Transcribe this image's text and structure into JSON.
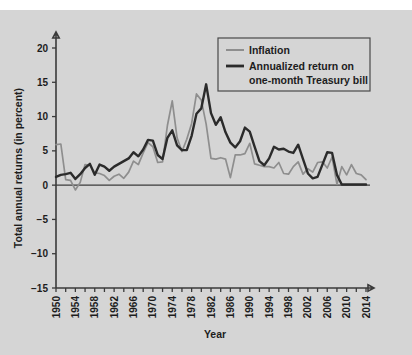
{
  "chart_data": {
    "type": "line",
    "title": "",
    "xlabel": "Year",
    "ylabel": "Total annual returns (in percent)",
    "xlim": [
      1950,
      2014
    ],
    "ylim": [
      -15,
      22
    ],
    "yticks": [
      20,
      15,
      10,
      5,
      0,
      -5,
      -10,
      -15
    ],
    "ytick_labels": [
      "20",
      "15",
      "10",
      "5",
      "0",
      "−5",
      "−10",
      "−15"
    ],
    "xticks": [
      1950,
      1952,
      1954,
      1956,
      1958,
      1960,
      1962,
      1964,
      1966,
      1968,
      1970,
      1972,
      1974,
      1976,
      1978,
      1980,
      1982,
      1984,
      1986,
      1988,
      1990,
      1992,
      1994,
      1996,
      1998,
      2000,
      2002,
      2004,
      2006,
      2008,
      2010,
      2012,
      2014
    ],
    "xtick_labels": [
      "1950",
      "1954",
      "1958",
      "1962",
      "1966",
      "1970",
      "1974",
      "1978",
      "1982",
      "1986",
      "1990",
      "1994",
      "1998",
      "2002",
      "2006",
      "2010",
      "2014"
    ],
    "xtick_label_years": [
      1950,
      1954,
      1958,
      1962,
      1966,
      1970,
      1974,
      1978,
      1982,
      1986,
      1990,
      1994,
      1998,
      2002,
      2006,
      2010,
      2014
    ],
    "grid": false,
    "legend_position": "top-right",
    "x": [
      1950,
      1951,
      1952,
      1953,
      1954,
      1955,
      1956,
      1957,
      1958,
      1959,
      1960,
      1961,
      1962,
      1963,
      1964,
      1965,
      1966,
      1967,
      1968,
      1969,
      1970,
      1971,
      1972,
      1973,
      1974,
      1975,
      1976,
      1977,
      1978,
      1979,
      1980,
      1981,
      1982,
      1983,
      1984,
      1985,
      1986,
      1987,
      1988,
      1989,
      1990,
      1991,
      1992,
      1993,
      1994,
      1995,
      1996,
      1997,
      1998,
      1999,
      2000,
      2001,
      2002,
      2003,
      2004,
      2005,
      2006,
      2007,
      2008,
      2009,
      2010,
      2011,
      2012,
      2013,
      2014
    ],
    "series": [
      {
        "name": "Inflation",
        "color": "#8e8e8e",
        "values": [
          5.9,
          6.0,
          0.8,
          0.7,
          -0.7,
          0.4,
          3.0,
          2.9,
          1.8,
          1.7,
          1.4,
          0.7,
          1.3,
          1.6,
          1.0,
          1.9,
          3.5,
          3.0,
          4.7,
          6.2,
          5.6,
          3.3,
          3.4,
          8.7,
          12.3,
          6.9,
          4.9,
          6.7,
          9.0,
          13.3,
          12.4,
          8.9,
          3.9,
          3.8,
          4.0,
          3.8,
          1.1,
          4.4,
          4.4,
          4.6,
          6.1,
          3.1,
          2.9,
          2.7,
          2.7,
          2.5,
          3.3,
          1.7,
          1.6,
          2.7,
          3.4,
          1.6,
          2.4,
          1.9,
          3.3,
          3.4,
          2.5,
          4.1,
          0.1,
          2.7,
          1.5,
          3.0,
          1.7,
          1.5,
          0.8
        ],
        "values_note": "CPI annual inflation rate in percent"
      },
      {
        "name": "Annualized return on one-month Treasury bill",
        "color": "#2b2b2b",
        "values": [
          1.2,
          1.5,
          1.6,
          1.8,
          0.9,
          1.6,
          2.5,
          3.1,
          1.5,
          3.0,
          2.7,
          2.1,
          2.7,
          3.1,
          3.5,
          3.9,
          4.8,
          4.2,
          5.2,
          6.6,
          6.5,
          4.4,
          3.8,
          6.9,
          8.0,
          5.8,
          5.1,
          5.1,
          7.2,
          10.4,
          11.2,
          14.7,
          10.5,
          8.8,
          9.9,
          7.7,
          6.2,
          5.5,
          6.4,
          8.4,
          7.8,
          5.6,
          3.5,
          2.9,
          3.9,
          5.6,
          5.2,
          5.3,
          4.9,
          4.7,
          5.9,
          3.8,
          1.7,
          1.0,
          1.2,
          3.0,
          4.8,
          4.7,
          1.5,
          0.1,
          0.1,
          0.1,
          0.1,
          0.1,
          0.1
        ],
        "values_note": "annualized one-month T-bill return in percent"
      }
    ]
  },
  "legend": {
    "items": [
      {
        "label": "Inflation"
      },
      {
        "label": "Annualized return on"
      },
      {
        "label": "one-month Treasury bill"
      }
    ]
  },
  "axes": {
    "y_title": "Total annual returns (in percent)",
    "x_title": "Year"
  },
  "colors": {
    "background": "#d5d5d5",
    "inflation": "#8e8e8e",
    "tbill": "#2b2b2b",
    "axis": "#3b3b3b"
  }
}
